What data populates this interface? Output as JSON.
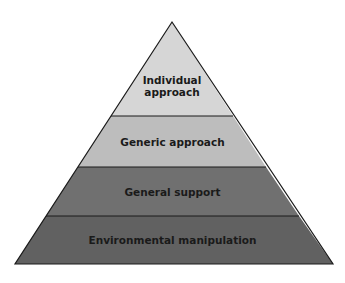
{
  "pyramid": {
    "levels": [
      {
        "label": "Individual approach",
        "line1": "Individual",
        "line2": "approach",
        "color": "#d6d6d6"
      },
      {
        "label": "Generic approach",
        "color": "#bdbdbd"
      },
      {
        "label": "General support",
        "color": "#707070"
      },
      {
        "label": "Environmental manipulation",
        "color": "#616161"
      }
    ],
    "outline_color": "#1a1a1a"
  }
}
